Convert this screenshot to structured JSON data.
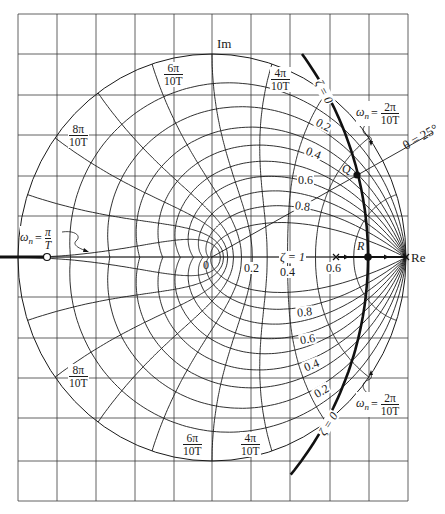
{
  "diagram": {
    "type": "z-plane constant damping ratio and natural frequency loci",
    "axes": {
      "real_label": "Re",
      "imag_label": "Im",
      "origin_label": "0"
    },
    "real_axis_ticks": [
      "0.2",
      "0.4",
      "0.6"
    ],
    "zeta_labels_upper": [
      "0.2",
      "0.4",
      "0.6",
      "0.8"
    ],
    "zeta_labels_lower": [
      "0.8",
      "0.6",
      "0.4",
      "0.2"
    ],
    "zeta_one_label": "ζ = 1",
    "zeta_zero_label": "ζ = 0",
    "theta_label": "θ = 25°",
    "point_Q": "Q",
    "point_R": "R",
    "wn_prefix": "ω",
    "wn_sub": "n",
    "wn_eq": "=",
    "freq_labels": [
      {
        "num": "2π",
        "den": "10T"
      },
      {
        "num": "4π",
        "den": "10T"
      },
      {
        "num": "6π",
        "den": "10T"
      },
      {
        "num": "8π",
        "den": "10T"
      },
      {
        "num": "π",
        "den": "T"
      }
    ],
    "zeta_values": [
      0,
      0.1,
      0.2,
      0.3,
      0.4,
      0.5,
      0.6,
      0.7,
      0.8,
      0.9,
      1.0
    ],
    "wnT_values_pi_fraction": [
      0.1,
      0.2,
      0.3,
      0.4,
      0.5,
      0.6,
      0.7,
      0.8,
      0.9,
      1.0
    ],
    "theta_deg": 25,
    "colors": {
      "line": "#1a1a1a",
      "grid": "#3a3a3a",
      "background": "#ffffff"
    }
  }
}
